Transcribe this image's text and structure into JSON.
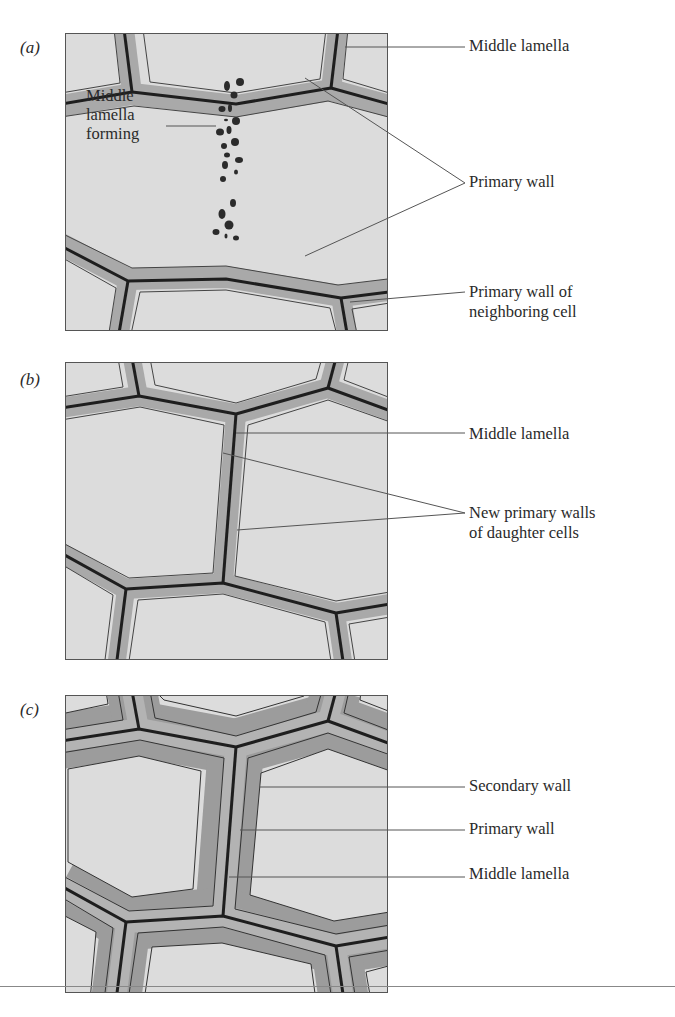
{
  "figure": {
    "panels": [
      {
        "id": "a",
        "label": "(a)",
        "stage": "cell plate forming",
        "inner_label": {
          "line1": "Middle",
          "line2": "lamella",
          "line3": "forming"
        },
        "callouts": [
          {
            "text": "Middle lamella"
          },
          {
            "text": "Primary wall"
          },
          {
            "line1": "Primary wall of",
            "line2": "neighboring cell"
          }
        ]
      },
      {
        "id": "b",
        "label": "(b)",
        "stage": "daughter cells with new primary walls",
        "callouts": [
          {
            "text": "Middle lamella"
          },
          {
            "line1": "New primary walls",
            "line2": "of daughter cells"
          }
        ]
      },
      {
        "id": "c",
        "label": "(c)",
        "stage": "secondary wall deposited",
        "callouts": [
          {
            "text": "Secondary wall"
          },
          {
            "text": "Primary wall"
          },
          {
            "text": "Middle lamella"
          }
        ]
      }
    ],
    "colors": {
      "cytoplasm": "#dcdcdc",
      "primary_wall": "#a9a9a9",
      "secondary_wall": "#9c9c9c",
      "middle_lamella": "#1e1e1e",
      "leader_line": "#555555"
    }
  }
}
